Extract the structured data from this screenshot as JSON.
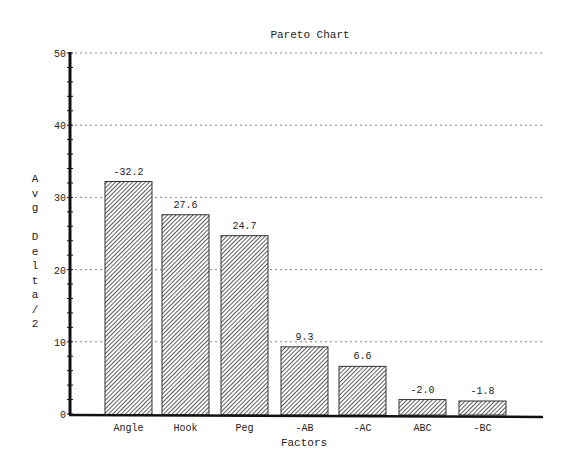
{
  "chart_data": {
    "type": "bar",
    "title": "Pareto Chart",
    "xlabel": "Factors",
    "ylabel": "Avg Delta/2",
    "ylabel_chars": [
      "A",
      "v",
      "g",
      "",
      "D",
      "e",
      "l",
      "t",
      "a",
      "/",
      "2"
    ],
    "categories": [
      "Angle",
      "Hook",
      "Peg",
      "-AB",
      "-AC",
      "ABC",
      "-BC"
    ],
    "values": [
      32.2,
      27.6,
      24.7,
      9.3,
      6.6,
      2.0,
      1.8
    ],
    "data_labels": [
      "-32.2",
      "27.6",
      "24.7",
      "9.3",
      "6.6",
      "-2.0",
      "-1.8"
    ],
    "ylim": [
      0,
      50
    ],
    "yticks": [
      0,
      10,
      20,
      30,
      40,
      50
    ],
    "minor_tick_step": 2,
    "grid": true,
    "grid_style": "dotted horizontal at major ticks",
    "legend": null,
    "bar_fill": "diagonal hatch",
    "colors": {
      "bar_hatch": "#333333",
      "bar_bg": "#ffffff",
      "axis": "#111111",
      "grid": "#888888"
    }
  }
}
